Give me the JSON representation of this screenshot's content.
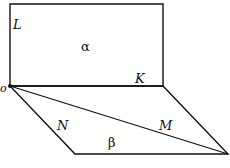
{
  "diagram": {
    "title": "",
    "stroke_color": "#111111",
    "planes": [
      {
        "name": "alpha",
        "label": "α",
        "shape": "rectangle",
        "vertices": [
          [
            10,
            4
          ],
          [
            163,
            4
          ],
          [
            163,
            86
          ],
          [
            10,
            86
          ]
        ]
      },
      {
        "name": "beta",
        "label": "β",
        "shape": "parallelogram",
        "vertices": [
          [
            10,
            86
          ],
          [
            163,
            86
          ],
          [
            228,
            154
          ],
          [
            75,
            154
          ]
        ]
      }
    ],
    "segments": [
      {
        "name": "diagonal-OM",
        "from": [
          10,
          86
        ],
        "to": [
          228,
          154
        ]
      }
    ],
    "points": [
      {
        "name": "O",
        "label": "o",
        "x": 10,
        "y": 86
      }
    ],
    "labels": {
      "L": "L",
      "alpha": "α",
      "K": "K",
      "O": "o",
      "N": "N",
      "M": "M",
      "beta": "β"
    }
  }
}
